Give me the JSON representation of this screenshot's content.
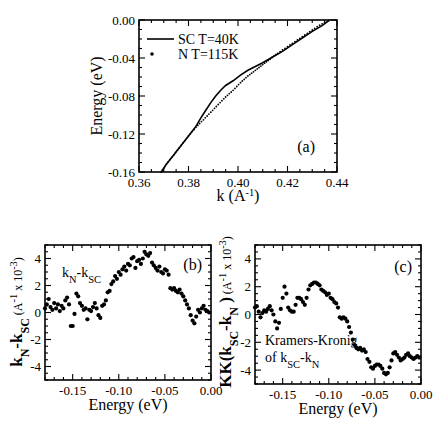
{
  "chart_data": [
    {
      "id": "a",
      "type": "line",
      "panel_label": "(a)",
      "xlabel": "k (A^-1)",
      "ylabel": "Energy (eV)",
      "xlim": [
        0.36,
        0.44
      ],
      "ylim": [
        -0.16,
        0.0
      ],
      "xticks": [
        0.36,
        0.38,
        0.4,
        0.42,
        0.44
      ],
      "xtick_labels": [
        "0.36",
        "0.38",
        "0.40",
        "0.42",
        "0.44"
      ],
      "yticks": [
        0.0,
        -0.04,
        -0.08,
        -0.12,
        -0.16
      ],
      "ytick_labels": [
        "0.00",
        "-0.04",
        "-0.08",
        "-0.12",
        "-0.16"
      ],
      "legend": [
        {
          "label": "SC T=40K",
          "style": "solid-line"
        },
        {
          "label": "N T=115K",
          "style": "dots"
        }
      ],
      "series": [
        {
          "name": "SC T=40K",
          "x": [
            0.369,
            0.371,
            0.374,
            0.377,
            0.38,
            0.383,
            0.385,
            0.387,
            0.389,
            0.391,
            0.393,
            0.395,
            0.398,
            0.401,
            0.404,
            0.407,
            0.41,
            0.414,
            0.418,
            0.422,
            0.426,
            0.43,
            0.434,
            0.437
          ],
          "y": [
            -0.16,
            -0.152,
            -0.142,
            -0.132,
            -0.122,
            -0.112,
            -0.103,
            -0.095,
            -0.087,
            -0.08,
            -0.074,
            -0.069,
            -0.064,
            -0.058,
            -0.053,
            -0.049,
            -0.045,
            -0.039,
            -0.033,
            -0.026,
            -0.019,
            -0.012,
            -0.006,
            0.0
          ]
        },
        {
          "name": "N T=115K",
          "x": [
            0.369,
            0.371,
            0.374,
            0.377,
            0.38,
            0.383,
            0.386,
            0.389,
            0.392,
            0.395,
            0.398,
            0.401,
            0.404,
            0.407,
            0.41,
            0.413,
            0.416,
            0.42,
            0.424,
            0.428,
            0.432,
            0.436
          ],
          "y": [
            -0.16,
            -0.152,
            -0.142,
            -0.132,
            -0.122,
            -0.113,
            -0.105,
            -0.097,
            -0.089,
            -0.081,
            -0.074,
            -0.066,
            -0.059,
            -0.053,
            -0.047,
            -0.041,
            -0.035,
            -0.028,
            -0.021,
            -0.014,
            -0.007,
            -0.001
          ]
        }
      ]
    },
    {
      "id": "b",
      "type": "scatter",
      "panel_label": "(b)",
      "annotation": "kN-kSC",
      "xlabel": "Energy (eV)",
      "ylabel": "kN-kSC (A^-1 x 10^-3)",
      "ylabel_main": "k",
      "xlim": [
        -0.18,
        0.0
      ],
      "ylim": [
        -5,
        5
      ],
      "xticks": [
        -0.15,
        -0.1,
        -0.05,
        0.0
      ],
      "xtick_labels": [
        "-0.15",
        "-0.10",
        "-0.05",
        "0.00"
      ],
      "yticks": [
        4,
        2,
        0,
        -2,
        -4
      ],
      "ytick_labels": [
        "4",
        "2",
        "0",
        "-2",
        "-4"
      ],
      "series": [
        {
          "name": "kN-kSC",
          "x": [
            -0.18,
            -0.178,
            -0.176,
            -0.174,
            -0.172,
            -0.17,
            -0.168,
            -0.166,
            -0.164,
            -0.162,
            -0.16,
            -0.158,
            -0.156,
            -0.154,
            -0.152,
            -0.15,
            -0.148,
            -0.146,
            -0.144,
            -0.142,
            -0.14,
            -0.138,
            -0.136,
            -0.134,
            -0.132,
            -0.13,
            -0.128,
            -0.126,
            -0.124,
            -0.122,
            -0.12,
            -0.118,
            -0.116,
            -0.114,
            -0.112,
            -0.11,
            -0.108,
            -0.106,
            -0.104,
            -0.102,
            -0.1,
            -0.098,
            -0.096,
            -0.094,
            -0.092,
            -0.09,
            -0.088,
            -0.086,
            -0.084,
            -0.082,
            -0.08,
            -0.078,
            -0.076,
            -0.074,
            -0.072,
            -0.07,
            -0.068,
            -0.066,
            -0.064,
            -0.062,
            -0.06,
            -0.058,
            -0.056,
            -0.054,
            -0.052,
            -0.05,
            -0.048,
            -0.046,
            -0.044,
            -0.042,
            -0.04,
            -0.038,
            -0.036,
            -0.034,
            -0.032,
            -0.03,
            -0.028,
            -0.026,
            -0.024,
            -0.022,
            -0.02,
            -0.018,
            -0.016,
            -0.014,
            -0.012,
            -0.01,
            -0.008,
            -0.006,
            -0.004,
            -0.002
          ],
          "y": [
            0.3,
            0.6,
            1.0,
            0.4,
            0.2,
            0.7,
            0.3,
            0.6,
            0.1,
            0.5,
            0.3,
            0.9,
            1.1,
            0.6,
            -1.0,
            -1.0,
            -0.1,
            1.4,
            1.2,
            0.7,
            0.5,
            0.2,
            0.3,
            -0.5,
            0.2,
            0.1,
            0.4,
            0.7,
            0.3,
            -0.2,
            -0.4,
            0.5,
            0.6,
            0.9,
            1.5,
            1.6,
            2.1,
            2.3,
            2.7,
            2.5,
            3.0,
            2.8,
            3.2,
            3.4,
            3.1,
            3.6,
            3.5,
            4.0,
            4.1,
            3.3,
            3.8,
            3.9,
            3.6,
            4.0,
            4.5,
            4.3,
            4.2,
            4.4,
            3.7,
            3.5,
            3.3,
            3.1,
            3.4,
            3.0,
            2.9,
            3.2,
            3.1,
            2.8,
            1.8,
            1.7,
            1.8,
            1.6,
            1.5,
            1.7,
            1.4,
            1.2,
            0.9,
            0.6,
            0.3,
            -0.2,
            -0.6,
            -0.8,
            -0.3,
            0.2,
            0.0,
            0.3,
            0.5,
            0.2,
            0.1,
            0.0
          ]
        }
      ]
    },
    {
      "id": "c",
      "type": "scatter",
      "panel_label": "(c)",
      "annotation_line1": "Kramers-Kronig",
      "annotation_line2": "of kSC-kN",
      "xlabel": "Energy (eV)",
      "ylabel": "KK(kSC-kN) (A^-1 x 10^-3)",
      "xlim": [
        -0.18,
        0.0
      ],
      "ylim": [
        -5,
        5
      ],
      "xticks": [
        -0.15,
        -0.1,
        -0.05,
        0.0
      ],
      "xtick_labels": [
        "-0.15",
        "-0.10",
        "-0.05",
        "0.00"
      ],
      "yticks": [
        4,
        2,
        0,
        -2,
        -4
      ],
      "ytick_labels": [
        "4",
        "2",
        "0",
        "-2",
        "-4"
      ],
      "series": [
        {
          "name": "KK(kSC-kN)",
          "x": [
            -0.18,
            -0.178,
            -0.176,
            -0.174,
            -0.172,
            -0.17,
            -0.168,
            -0.166,
            -0.164,
            -0.162,
            -0.16,
            -0.158,
            -0.156,
            -0.154,
            -0.152,
            -0.15,
            -0.148,
            -0.146,
            -0.144,
            -0.142,
            -0.14,
            -0.138,
            -0.136,
            -0.134,
            -0.132,
            -0.13,
            -0.128,
            -0.126,
            -0.124,
            -0.122,
            -0.12,
            -0.118,
            -0.116,
            -0.114,
            -0.112,
            -0.11,
            -0.108,
            -0.106,
            -0.104,
            -0.102,
            -0.1,
            -0.098,
            -0.096,
            -0.094,
            -0.092,
            -0.09,
            -0.088,
            -0.086,
            -0.084,
            -0.082,
            -0.08,
            -0.078,
            -0.076,
            -0.074,
            -0.072,
            -0.07,
            -0.068,
            -0.066,
            -0.064,
            -0.062,
            -0.06,
            -0.058,
            -0.056,
            -0.054,
            -0.052,
            -0.05,
            -0.048,
            -0.046,
            -0.044,
            -0.042,
            -0.04,
            -0.038,
            -0.036,
            -0.034,
            -0.032,
            -0.03,
            -0.028,
            -0.026,
            -0.024,
            -0.022,
            -0.02,
            -0.018,
            -0.016,
            -0.014,
            -0.012,
            -0.01,
            -0.008,
            -0.006,
            -0.004,
            -0.002
          ],
          "y": [
            0.5,
            0.6,
            0.2,
            -0.2,
            0.1,
            0.3,
            0.2,
            0.4,
            0.6,
            0.3,
            0.0,
            -0.5,
            -1.0,
            -0.6,
            0.4,
            1.2,
            2.0,
            1.5,
            0.5,
            0.3,
            0.2,
            0.2,
            0.7,
            1.2,
            1.2,
            1.1,
            0.9,
            0.7,
            1.2,
            1.8,
            2.1,
            2.2,
            2.3,
            2.3,
            2.2,
            2.1,
            1.8,
            1.7,
            1.6,
            1.4,
            1.5,
            1.2,
            1.1,
            0.9,
            0.8,
            0.5,
            -0.2,
            -0.3,
            -0.2,
            -0.3,
            -0.5,
            -0.9,
            -1.3,
            -1.8,
            -2.2,
            -2.4,
            -2.5,
            -2.4,
            -2.6,
            -2.5,
            -2.7,
            -3.2,
            -3.4,
            -3.8,
            -3.9,
            -3.7,
            -3.6,
            -3.6,
            -3.7,
            -3.9,
            -4.2,
            -4.3,
            -4.2,
            -3.8,
            -3.3,
            -2.8,
            -2.7,
            -2.9,
            -3.1,
            -3.3,
            -3.2,
            -3.1,
            -2.9,
            -2.8,
            -3.0,
            -3.1,
            -3.2,
            -3.1,
            -3.0,
            -3.1
          ]
        }
      ]
    }
  ],
  "layout": {
    "a": {
      "left": 139,
      "right": 337,
      "top": 20,
      "bottom": 172
    },
    "b": {
      "left": 45,
      "right": 211,
      "top": 245,
      "bottom": 380
    },
    "c": {
      "left": 255,
      "right": 421,
      "top": 245,
      "bottom": 384
    }
  },
  "colors": {
    "ink": "#000000",
    "background": "#ffffff"
  }
}
